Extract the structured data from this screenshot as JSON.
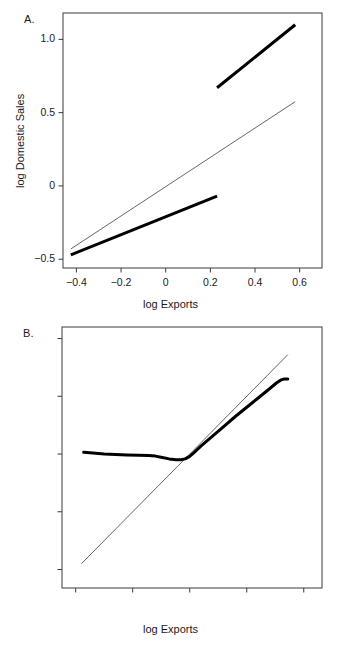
{
  "figure": {
    "panels": [
      {
        "letter": "A.",
        "xlabel": "log Exports",
        "ylabel": "log Domestic Sales"
      },
      {
        "letter": "B.",
        "xlabel": "log Exports",
        "ylabel": "log Domestic Sales"
      }
    ]
  },
  "panel_a": {
    "letter": "A.",
    "xlabel": "log Exports",
    "ylabel": "log Domestic Sales",
    "yticks": [
      "1.0",
      "0.5",
      "0",
      "-0.5"
    ],
    "xticks": [
      "-0.4",
      "-0.2",
      "0",
      "0.2",
      "0.4",
      "0.6"
    ]
  },
  "panel_b": {
    "letter": "B.",
    "xlabel": "log Exports",
    "ylabel": "log Domestic Sales",
    "yticks": [
      "10",
      "5",
      "0",
      "-5",
      "-10"
    ],
    "xticks": [
      "-10",
      "-5",
      "0",
      "5",
      "10"
    ]
  },
  "chart_data": [
    {
      "id": "panel-a",
      "type": "line",
      "title": "A.",
      "xlabel": "log Exports",
      "ylabel": "log Domestic Sales",
      "xlim": [
        -0.46,
        0.7
      ],
      "ylim": [
        -0.56,
        1.18
      ],
      "xticks": [
        -0.4,
        -0.2,
        0,
        0.2,
        0.4,
        0.6
      ],
      "xticklabels": [
        "-0.4",
        "-0.2",
        "0",
        "0.2",
        "0.4",
        "0.6"
      ],
      "yticks": [
        1.0,
        0.5,
        0,
        -0.5
      ],
      "yticklabels": [
        "1.0",
        "0.5",
        "0",
        "-0.5"
      ],
      "grid": false,
      "legend": "none",
      "series": [
        {
          "name": "reference line (thin, 45 degree)",
          "style": "thin",
          "linewidth": 0.7,
          "color": "#222222",
          "x": [
            -0.425,
            0.58
          ],
          "y": [
            -0.43,
            0.575
          ]
        },
        {
          "name": "fitted segment lower (thick)",
          "style": "thick",
          "linewidth": 3.0,
          "color": "#000000",
          "x": [
            -0.425,
            0.23
          ],
          "y": [
            -0.47,
            -0.07
          ]
        },
        {
          "name": "fitted segment upper (thick)",
          "style": "thick",
          "linewidth": 3.0,
          "color": "#000000",
          "x": [
            0.23,
            0.58
          ],
          "y": [
            0.67,
            1.1
          ]
        }
      ]
    },
    {
      "id": "panel-b",
      "type": "line",
      "title": "B.",
      "xlabel": "log Exports",
      "ylabel": "log Domestic Sales",
      "xlim": [
        -11.2,
        11.6
      ],
      "ylim": [
        -11.6,
        11.0
      ],
      "xticks": [
        -10,
        -5,
        0,
        5,
        10
      ],
      "xticklabels": [
        "-10",
        "-5",
        "0",
        "5",
        "10"
      ],
      "yticks": [
        10,
        5,
        0,
        -5,
        -10
      ],
      "yticklabels": [
        "10",
        "5",
        "0",
        "-5",
        "-10"
      ],
      "grid": false,
      "legend": "none",
      "series": [
        {
          "name": "reference line (thin, 45 degree)",
          "style": "thin",
          "linewidth": 0.7,
          "color": "#222222",
          "x": [
            -9.5,
            8.6
          ],
          "y": [
            -9.5,
            8.6
          ]
        },
        {
          "name": "fitted curve (thick)",
          "style": "thick",
          "linewidth": 3.0,
          "color": "#000000",
          "x": [
            -9.3,
            -8.5,
            -7.5,
            -6.5,
            -5.5,
            -4.5,
            -3.6,
            -3.0,
            -2.4,
            -1.8,
            -1.2,
            -0.8,
            -0.4,
            0.0,
            0.4,
            1.0,
            2.0,
            3.0,
            4.0,
            5.0,
            6.0,
            7.0,
            7.6,
            8.0,
            8.3,
            8.6
          ],
          "y": [
            0.15,
            0.08,
            0.0,
            -0.05,
            -0.08,
            -0.1,
            -0.12,
            -0.18,
            -0.3,
            -0.42,
            -0.5,
            -0.5,
            -0.42,
            -0.2,
            0.15,
            0.7,
            1.55,
            2.4,
            3.25,
            4.05,
            4.85,
            5.65,
            6.15,
            6.42,
            6.5,
            6.5
          ]
        }
      ]
    }
  ]
}
